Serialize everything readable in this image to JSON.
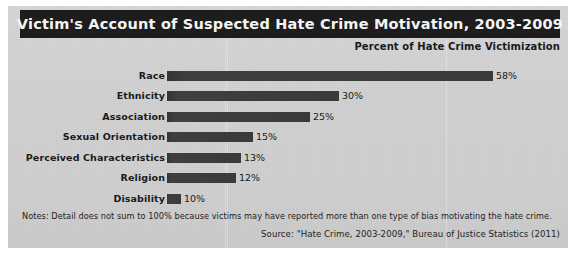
{
  "figure": {
    "title": "Victim's Account of Suspected Hate Crime Motivation, 2003-2009",
    "subtitle": "Percent of Hate Crime Victimization",
    "notes": "Notes: Detail does not sum to 100% because victims may have reported more than one type of bias motivating the hate crime.",
    "source": "Source: \"Hate Crime, 2003-2009,\" Bureau of Justice Statistics (2011)",
    "colors": {
      "title_band": "#1d1d1d",
      "title_text": "#f4f4f4",
      "background": "#d0d0d0",
      "bar": "#3b3b3b",
      "text": "#1a1a1a"
    }
  },
  "chart_data": {
    "type": "bar",
    "orientation": "horizontal",
    "title": "Victim's Account of Suspected Hate Crime Motivation, 2003-2009",
    "subtitle": "Percent of Hate Crime Victimization",
    "xlabel": "Percent of Hate Crime Victimization",
    "ylabel": "",
    "xlim": [
      0,
      60
    ],
    "grid": false,
    "legend": null,
    "categories": [
      "Race",
      "Ethnicity",
      "Association",
      "Sexual Orientation",
      "Perceived Characteristics",
      "Religion",
      "Disability"
    ],
    "values": [
      58,
      30,
      25,
      15,
      13,
      12,
      10
    ],
    "data_labels": [
      "58%",
      "30%",
      "25%",
      "15%",
      "13%",
      "12%",
      "10%"
    ],
    "bar_pixel_widths": [
      326,
      172,
      143,
      86,
      74,
      69,
      14
    ],
    "rows": [
      {
        "label": "Race",
        "value": 58,
        "data_label": "58%",
        "bar_px": 326,
        "top": 5
      },
      {
        "label": "Ethnicity",
        "value": 30,
        "data_label": "30%",
        "bar_px": 172,
        "top": 25
      },
      {
        "label": "Association",
        "value": 25,
        "data_label": "25%",
        "bar_px": 143,
        "top": 46
      },
      {
        "label": "Sexual Orientation",
        "value": 15,
        "data_label": "15%",
        "bar_px": 86,
        "top": 66
      },
      {
        "label": "Perceived Characteristics",
        "value": 13,
        "data_label": "13%",
        "bar_px": 74,
        "top": 87
      },
      {
        "label": "Religion",
        "value": 12,
        "data_label": "12%",
        "bar_px": 69,
        "top": 107
      },
      {
        "label": "Disability",
        "value": 10,
        "data_label": "10%",
        "bar_px": 14,
        "top": 128
      }
    ]
  }
}
